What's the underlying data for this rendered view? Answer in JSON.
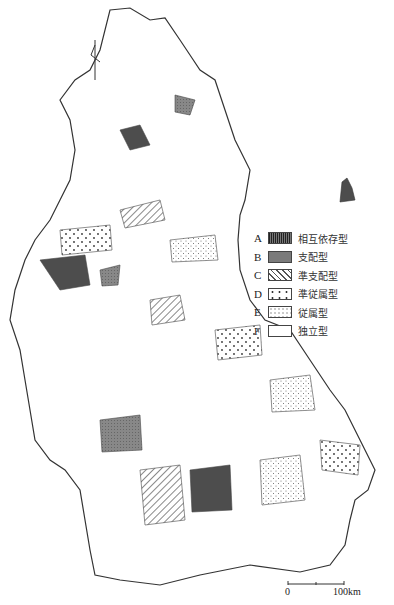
{
  "map": {
    "type": "choropleth",
    "region": "West Germany (districts)",
    "legend": [
      {
        "letter": "A",
        "label": "相互依存型",
        "pattern": "dense-vertical-hatch"
      },
      {
        "letter": "B",
        "label": "支配型",
        "pattern": "dark-gray-fill"
      },
      {
        "letter": "C",
        "label": "準支配型",
        "pattern": "diagonal-hatch"
      },
      {
        "letter": "D",
        "label": "準従属型",
        "pattern": "large-dots"
      },
      {
        "letter": "E",
        "label": "従属型",
        "pattern": "small-dots"
      },
      {
        "letter": "F",
        "label": "独立型",
        "pattern": "blank"
      }
    ],
    "scale": {
      "zero": "0",
      "max": "100km"
    },
    "north_arrow": "north-arrow-icon"
  },
  "colors": {
    "ink": "#333333",
    "paper": "#ffffff",
    "dark": "#555555",
    "hatch": "#666666"
  }
}
